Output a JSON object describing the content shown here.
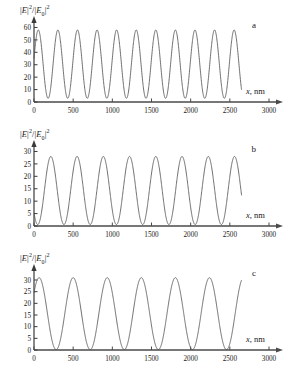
{
  "figure": {
    "panels": [
      {
        "letter": "a",
        "ylabel": "|E|2/|E0|2",
        "xlabel": "x, nm",
        "yticks": [
          0,
          10,
          20,
          30,
          40,
          50,
          60
        ],
        "xticks": [
          0,
          500,
          1000,
          1500,
          2000,
          2500,
          3000
        ]
      },
      {
        "letter": "b",
        "ylabel": "|E|2/|E0|2",
        "xlabel": "x, nm",
        "yticks": [
          0,
          5,
          10,
          15,
          20,
          25,
          30
        ],
        "xticks": [
          0,
          500,
          1000,
          1500,
          2000,
          2500,
          3000
        ]
      },
      {
        "letter": "c",
        "ylabel": "|E|2/|E0|2",
        "xlabel": "x, nm",
        "yticks": [
          0,
          5,
          10,
          15,
          20,
          25,
          30
        ],
        "xticks": [
          0,
          500,
          1000,
          1500,
          2000,
          2500,
          3000
        ]
      }
    ]
  },
  "chart_data": [
    {
      "type": "line",
      "title": "",
      "panel_label": "a",
      "xlabel": "x, nm",
      "ylabel": "|E|^2/|E_0|^2",
      "xlim": [
        0,
        3000
      ],
      "ylim": [
        0,
        62
      ],
      "xticks": [
        0,
        500,
        1000,
        1500,
        2000,
        2500,
        3000
      ],
      "yticks": [
        0,
        10,
        20,
        30,
        40,
        50,
        60
      ],
      "grid": false,
      "legend": "none",
      "series": [
        {
          "name": "field-intensity-a",
          "period_nm": 250,
          "peak_value": 58,
          "trough_value": 3,
          "x_start": 0,
          "x_end": 2650,
          "y_at_x_start": 35,
          "y_at_x_end": 28,
          "n_oscillations": 10.6,
          "peaks_x": [
            55,
            305,
            555,
            805,
            1055,
            1305,
            1555,
            1805,
            2055,
            2305,
            2555
          ],
          "peaks_y": [
            58,
            58.5,
            57.5,
            59,
            57.5,
            58.5,
            57,
            58.5,
            57.5,
            58,
            57.5
          ],
          "troughs_x": [
            180,
            430,
            680,
            930,
            1180,
            1430,
            1680,
            1930,
            2180,
            2430
          ],
          "troughs_y": [
            3,
            3.5,
            3,
            4,
            3,
            3.5,
            3,
            3.5,
            3,
            3.5
          ]
        }
      ]
    },
    {
      "type": "line",
      "title": "",
      "panel_label": "b",
      "xlabel": "x, nm",
      "ylabel": "|E|^2/|E_0|^2",
      "xlim": [
        0,
        3000
      ],
      "ylim": [
        0,
        31
      ],
      "xticks": [
        0,
        500,
        1000,
        1500,
        2000,
        2500,
        3000
      ],
      "yticks": [
        0,
        5,
        10,
        15,
        20,
        25,
        30
      ],
      "grid": false,
      "legend": "none",
      "series": [
        {
          "name": "field-intensity-b",
          "period_nm": 335,
          "peak_value": 28,
          "trough_value": 0.6,
          "x_start": 0,
          "x_end": 2650,
          "y_at_x_start": 7,
          "y_at_x_end": 10,
          "n_oscillations": 7.9,
          "peaks_x": [
            215,
            550,
            885,
            1215,
            1550,
            1885,
            2215,
            2550
          ],
          "peaks_y": [
            27,
            28.5,
            28.5,
            26.5,
            28,
            26.5,
            27.5,
            28
          ],
          "troughs_x": [
            50,
            385,
            720,
            1050,
            1385,
            1720,
            2050,
            2385
          ],
          "troughs_y": [
            0.5,
            0.6,
            0.6,
            0.8,
            0.6,
            0.8,
            0.2,
            0.8
          ]
        }
      ]
    },
    {
      "type": "line",
      "title": "",
      "panel_label": "c",
      "xlabel": "x, nm",
      "ylabel": "|E|^2/|E_0|^2",
      "xlim": [
        0,
        3000
      ],
      "ylim": [
        0,
        33
      ],
      "xticks": [
        0,
        500,
        1000,
        1500,
        2000,
        2500,
        3000
      ],
      "yticks": [
        0,
        5,
        10,
        15,
        20,
        25,
        30
      ],
      "grid": false,
      "legend": "none",
      "series": [
        {
          "name": "field-intensity-c",
          "period_nm": 435,
          "peak_value": 31,
          "trough_value": 0.2,
          "x_start": 0,
          "x_end": 2650,
          "y_at_x_start": 22,
          "y_at_x_end": 24,
          "n_oscillations": 6.3,
          "peaks_x": [
            65,
            500,
            935,
            1370,
            1805,
            2240
          ],
          "peaks_y": [
            31,
            31,
            30.5,
            31.5,
            30.5,
            30.5
          ],
          "troughs_x": [
            283,
            718,
            1153,
            1588,
            2023,
            2458
          ],
          "troughs_y": [
            0.2,
            0.2,
            0.3,
            0.2,
            0.3,
            0.2
          ]
        }
      ]
    }
  ]
}
